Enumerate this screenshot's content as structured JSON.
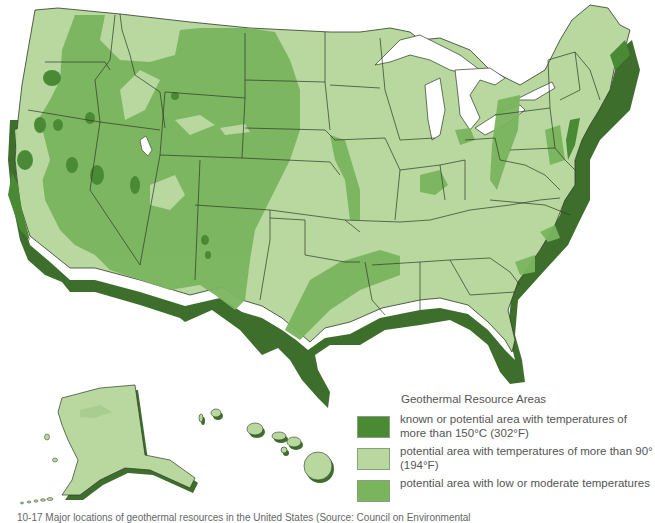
{
  "map": {
    "subject": "Geothermal resource areas of the United States",
    "regions_shown": [
      "Contiguous United States",
      "Alaska",
      "Hawaii"
    ],
    "colors": {
      "known_high_temp": "#4a8a35",
      "potential_90": "#b8d8a0",
      "low_moderate": "#7ab55e",
      "coast_shadow": "#3d6e2c",
      "state_border": "#2d3a26",
      "water": "#ffffff"
    }
  },
  "legend": {
    "title": "Geothermal Resource Areas",
    "items": [
      {
        "label": "known or potential area with temperatures of more than 150°C (302°F)",
        "color": "#4a8a35"
      },
      {
        "label": "potential area with temperatures of more than 90° (194°F)",
        "color": "#b8d8a0"
      },
      {
        "label": "potential area with low or moderate temperatures",
        "color": "#7ab55e"
      }
    ]
  },
  "caption": "10-17 Major locations of geothermal resources in the United States (Source: Council on Environmental"
}
